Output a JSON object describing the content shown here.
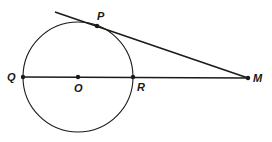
{
  "diagram": {
    "type": "geometry",
    "stroke_color": "#1a1a1a",
    "background": "#ffffff",
    "circle": {
      "center": "O",
      "cx": 78,
      "cy": 77,
      "r": 55
    },
    "points": {
      "P": {
        "label": "P",
        "x": 97,
        "y": 26
      },
      "Q": {
        "label": "Q",
        "x": 23,
        "y": 77
      },
      "O": {
        "label": "O",
        "x": 78,
        "y": 77
      },
      "R": {
        "label": "R",
        "x": 133,
        "y": 77
      },
      "M": {
        "label": "M",
        "x": 248,
        "y": 78
      }
    },
    "segments": [
      {
        "name": "tangent-line",
        "from": [
          55,
          12
        ],
        "to": [
          248,
          78
        ],
        "through": "P"
      },
      {
        "name": "secant-line",
        "from": [
          23,
          77
        ],
        "to": [
          248,
          78
        ],
        "through": [
          "Q",
          "O",
          "R"
        ]
      }
    ]
  }
}
